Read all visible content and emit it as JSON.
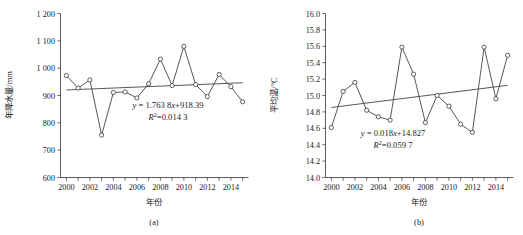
{
  "figure": {
    "panels": [
      {
        "caption": "(a)",
        "xlabel": "年份",
        "ylabel": "年降水量/mm",
        "equation_y": "y = 1.763 8x+918.39",
        "equation_r2_prefix": "R",
        "equation_r2_sup": "2",
        "equation_r2_value": "=0.014 3"
      },
      {
        "caption": "(b)",
        "xlabel": "年份",
        "ylabel": "平均温/°C",
        "equation_y": "y = 0.018x+14.827",
        "equation_r2_prefix": "R",
        "equation_r2_sup": "2",
        "equation_r2_value": "=0.059 7"
      }
    ]
  },
  "chart_data": [
    {
      "type": "line",
      "title": "(a)",
      "xlabel": "年份",
      "ylabel": "年降水量/mm",
      "x": [
        2000,
        2001,
        2002,
        2003,
        2004,
        2005,
        2006,
        2007,
        2008,
        2009,
        2010,
        2011,
        2012,
        2013,
        2014,
        2015
      ],
      "values": [
        973,
        927,
        957,
        755,
        911,
        913,
        891,
        943,
        1033,
        936,
        1080,
        940,
        896,
        977,
        932,
        877
      ],
      "xlim": [
        1999.5,
        2015.5
      ],
      "ylim": [
        600,
        1200
      ],
      "ytick_step": 100,
      "yticks": [
        "600",
        "700",
        "800",
        "900",
        "1 000",
        "1 100",
        "1 200"
      ],
      "xticks_labeled": [
        "2000",
        "2002",
        "2004",
        "2006",
        "2008",
        "2010",
        "2012",
        "2014"
      ],
      "xtick_every": 1,
      "grid": false,
      "legend": "none",
      "markers": "open-circle",
      "trendline": {
        "equation": "y = 1.763 8x+918.39",
        "r2": "0.014 3",
        "slope": 1.7638,
        "intercept": 918.39,
        "y_start": 920.2,
        "y_end": 946.6
      }
    },
    {
      "type": "line",
      "title": "(b)",
      "xlabel": "年份",
      "ylabel": "平均温/°C",
      "x": [
        2000,
        2001,
        2002,
        2003,
        2004,
        2005,
        2006,
        2007,
        2008,
        2009,
        2010,
        2011,
        2012,
        2013,
        2014,
        2015
      ],
      "values": [
        14.61,
        15.05,
        15.16,
        14.82,
        14.74,
        14.7,
        15.59,
        15.26,
        14.67,
        15.0,
        14.87,
        14.65,
        14.55,
        15.59,
        14.96,
        15.49
      ],
      "xlim": [
        1999.5,
        2015.5
      ],
      "ylim": [
        14.0,
        16.0
      ],
      "ytick_step": 0.2,
      "yticks": [
        "14.0",
        "14.2",
        "14.4",
        "14.6",
        "14.8",
        "15.0",
        "15.2",
        "15.4",
        "15.6",
        "15.8",
        "16.0"
      ],
      "xticks_labeled": [
        "2000",
        "2002",
        "2004",
        "2006",
        "2008",
        "2010",
        "2012",
        "2014"
      ],
      "xtick_every": 1,
      "grid": false,
      "legend": "none",
      "markers": "open-circle",
      "trendline": {
        "equation": "y = 0.018x+14.827",
        "r2": "0.059 7",
        "slope": 0.018,
        "intercept": 14.827,
        "y_start": 14.854,
        "y_end": 15.124
      }
    }
  ],
  "colors": {
    "line": "#3a3a3a",
    "axis": "#4a4a4a",
    "text": "#1a1a1a",
    "background": "#ffffff",
    "marker_fill": "#ffffff"
  }
}
